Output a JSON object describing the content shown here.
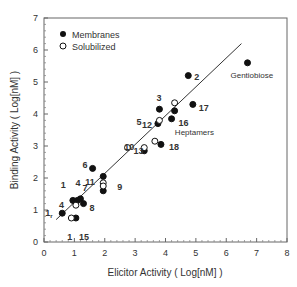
{
  "chart_data": {
    "type": "scatter",
    "title": "",
    "xlabel": "Elicitor Activity  ( Log[nM] )",
    "ylabel": "Binding Activity  ( Log[nM] )",
    "xlim": [
      0,
      8
    ],
    "ylim": [
      0,
      7
    ],
    "x_ticks": [
      "0",
      "1",
      "2",
      "3",
      "4",
      "5",
      "6",
      "7",
      "8"
    ],
    "y_ticks": [
      "0",
      "1",
      "2",
      "3",
      "4",
      "5",
      "6",
      "7"
    ],
    "grid": false,
    "legend": {
      "position": "upper-left",
      "entries": [
        {
          "label": "Membranes",
          "marker": "filled-circle"
        },
        {
          "label": "Solubilized",
          "marker": "open-circle"
        }
      ]
    },
    "series": [
      {
        "name": "Membranes",
        "marker": "filled",
        "points": [
          {
            "label": "Gentiobiose",
            "x": 6.7,
            "y": 5.6
          },
          {
            "label": "2",
            "x": 4.75,
            "y": 5.2
          },
          {
            "label": "17",
            "x": 4.9,
            "y": 4.3
          },
          {
            "label": "3",
            "x": 4.3,
            "y": 4.1
          },
          {
            "label": "5",
            "x": 3.8,
            "y": 4.15
          },
          {
            "label": "16",
            "x": 4.2,
            "y": 3.85
          },
          {
            "label": "12",
            "x": 3.75,
            "y": 3.7
          },
          {
            "label": "18",
            "x": 3.85,
            "y": 3.05
          },
          {
            "label": "10",
            "x": 3.3,
            "y": 2.85
          },
          {
            "label": "6",
            "x": 1.6,
            "y": 2.3
          },
          {
            "label": "11",
            "x": 1.95,
            "y": 2.05
          },
          {
            "label": "9",
            "x": 1.95,
            "y": 1.6
          },
          {
            "label": "1",
            "x": 0.95,
            "y": 1.3
          },
          {
            "label": "4",
            "x": 1.1,
            "y": 1.3
          },
          {
            "label": "7",
            "x": 1.2,
            "y": 1.35
          },
          {
            "label": "8",
            "x": 1.3,
            "y": 1.2
          },
          {
            "label": "1r",
            "x": 0.6,
            "y": 0.9
          },
          {
            "label": "15",
            "x": 1.05,
            "y": 0.75
          }
        ]
      },
      {
        "name": "Solubilized",
        "marker": "open",
        "points": [
          {
            "label": "3",
            "x": 4.3,
            "y": 4.35
          },
          {
            "label": "5",
            "x": 3.8,
            "y": 3.8
          },
          {
            "label": "Heptamers",
            "x": 3.65,
            "y": 3.15
          },
          {
            "label": "10",
            "x": 3.3,
            "y": 2.95
          },
          {
            "label": "13",
            "x": 2.75,
            "y": 2.95
          },
          {
            "label": "11",
            "x": 1.95,
            "y": 1.85
          },
          {
            "label": "9",
            "x": 1.95,
            "y": 1.75
          },
          {
            "label": "4",
            "x": 1.05,
            "y": 1.15
          },
          {
            "label": "1",
            "x": 0.9,
            "y": 0.75
          }
        ]
      }
    ],
    "fit_line": {
      "x": [
        0.4,
        6.5
      ],
      "y": [
        0.7,
        6.2
      ]
    },
    "annotations": [
      "Gentiobiose",
      "Heptamers",
      "1",
      "1r",
      "2",
      "3",
      "4",
      "5",
      "6",
      "7",
      "8",
      "9",
      "10",
      "11",
      "12",
      "13",
      "15",
      "16",
      "17",
      "18"
    ]
  }
}
